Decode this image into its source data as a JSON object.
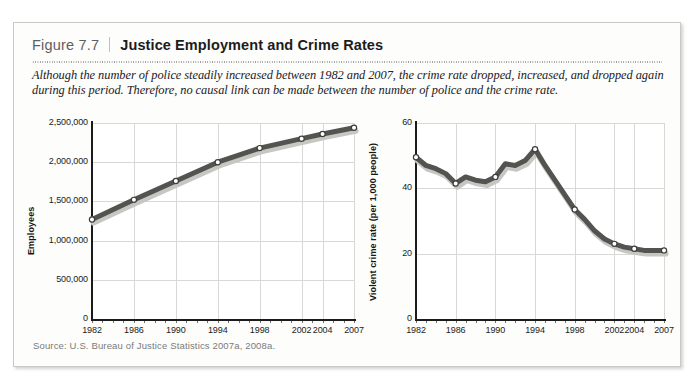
{
  "figure": {
    "number_label": "Figure 7.7",
    "title": "Justice Employment and Crime Rates",
    "caption": "Although the number of police steadily increased between 1982 and 2007, the crime rate dropped, increased, and dropped again during this period. Therefore, no causal link can be made between the number of police and the crime rate.",
    "source": "Source: U.S. Bureau of Justice Statistics 2007a, 2008a.",
    "page_bleed_text": "",
    "colors": {
      "line": "#53534f",
      "line_shadow": "#c6c6c2",
      "marker_fill": "#ffffff",
      "marker_stroke": "#3d3d3a",
      "grid": "#d8d8d8",
      "axis": "#1b1b1b",
      "box_border": "#c9c9c7",
      "panel_bg": "#fdfdfc",
      "fig_num_text": "#5f5f5f",
      "title_text": "#1c1c1c",
      "source_text": "#7b7b7b"
    }
  },
  "chart_data": [
    {
      "type": "line",
      "id": "justice-employment",
      "title": "",
      "xlabel": "",
      "ylabel": "Employees",
      "x": [
        1982,
        1986,
        1990,
        1994,
        1998,
        2002,
        2004,
        2007
      ],
      "values": [
        1270000,
        1520000,
        1760000,
        2000000,
        2180000,
        2300000,
        2360000,
        2440000
      ],
      "xtick_labels": [
        "1982",
        "1986",
        "1990",
        "1994",
        "1998",
        "2002",
        "2004",
        "2007"
      ],
      "ytick_labels": [
        "0",
        "500,000",
        "1,000,000",
        "1,500,000",
        "2,000,000",
        "2,500,000"
      ],
      "ytick_values": [
        0,
        500000,
        1000000,
        1500000,
        2000000,
        2500000
      ],
      "xlim": [
        1982,
        2007
      ],
      "ylim": [
        0,
        2500000
      ],
      "grid": true,
      "legend": "none",
      "minor_xticks": true
    },
    {
      "type": "line",
      "id": "violent-crime-rate",
      "title": "",
      "xlabel": "",
      "ylabel": "Violent crime rate (per 1,000 people)",
      "x": [
        1982,
        1986,
        1990,
        1994,
        1998,
        2002,
        2004,
        2007
      ],
      "values": [
        49.5,
        41.5,
        43.5,
        52.0,
        33.5,
        23.0,
        21.5,
        21.0
      ],
      "detail_x": [
        1982,
        1983,
        1984,
        1985,
        1986,
        1987,
        1988,
        1989,
        1990,
        1991,
        1992,
        1993,
        1994,
        1995,
        1996,
        1997,
        1998,
        1999,
        2000,
        2001,
        2002,
        2003,
        2004,
        2005,
        2006,
        2007
      ],
      "detail_values": [
        49.5,
        47.0,
        46.0,
        44.5,
        41.5,
        43.5,
        42.5,
        42.0,
        43.5,
        47.5,
        47.0,
        48.5,
        52.0,
        47.0,
        42.5,
        38.0,
        33.5,
        30.5,
        27.0,
        24.5,
        23.0,
        22.0,
        21.5,
        21.0,
        21.0,
        21.0
      ],
      "xtick_labels": [
        "1982",
        "1986",
        "1990",
        "1994",
        "1998",
        "2002",
        "2004",
        "2007"
      ],
      "ytick_labels": [
        "0",
        "20",
        "40",
        "60"
      ],
      "ytick_values": [
        0,
        20,
        40,
        60
      ],
      "xlim": [
        1982,
        2007
      ],
      "ylim": [
        0,
        60
      ],
      "grid": true,
      "legend": "none",
      "minor_xticks": true
    }
  ]
}
